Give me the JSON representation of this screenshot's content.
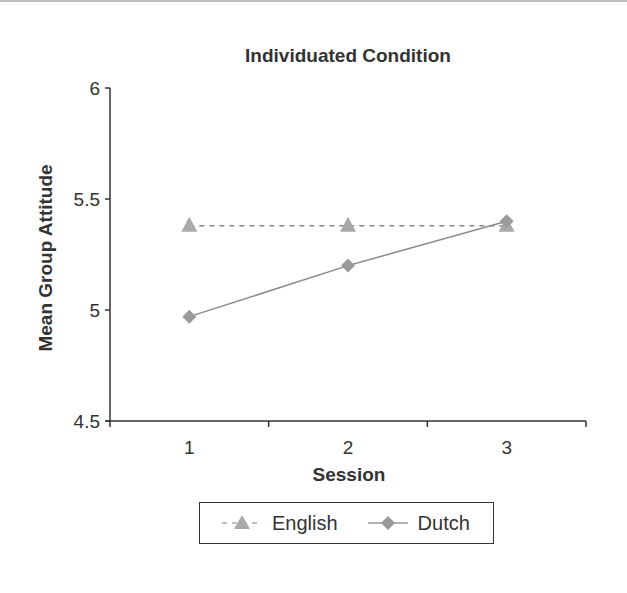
{
  "chart_data": {
    "type": "line",
    "title": "Individuated Condition",
    "xlabel": "Session",
    "ylabel": "Mean Group Attitude",
    "categories": [
      "1",
      "2",
      "3"
    ],
    "ylim": [
      4.5,
      6
    ],
    "yticks": [
      "6",
      "5.5",
      "5",
      "4.5"
    ],
    "grid": false,
    "legend_position": "bottom",
    "series": [
      {
        "name": "English",
        "values": [
          5.38,
          5.38,
          5.38
        ],
        "marker": "triangle",
        "line_style": "dashed",
        "color": "#a9a9a9"
      },
      {
        "name": "Dutch",
        "values": [
          4.97,
          5.2,
          5.4
        ],
        "marker": "diamond",
        "line_style": "solid",
        "color": "#9a9a9a"
      }
    ]
  },
  "legend": {
    "english_label": "English",
    "dutch_label": "Dutch"
  }
}
